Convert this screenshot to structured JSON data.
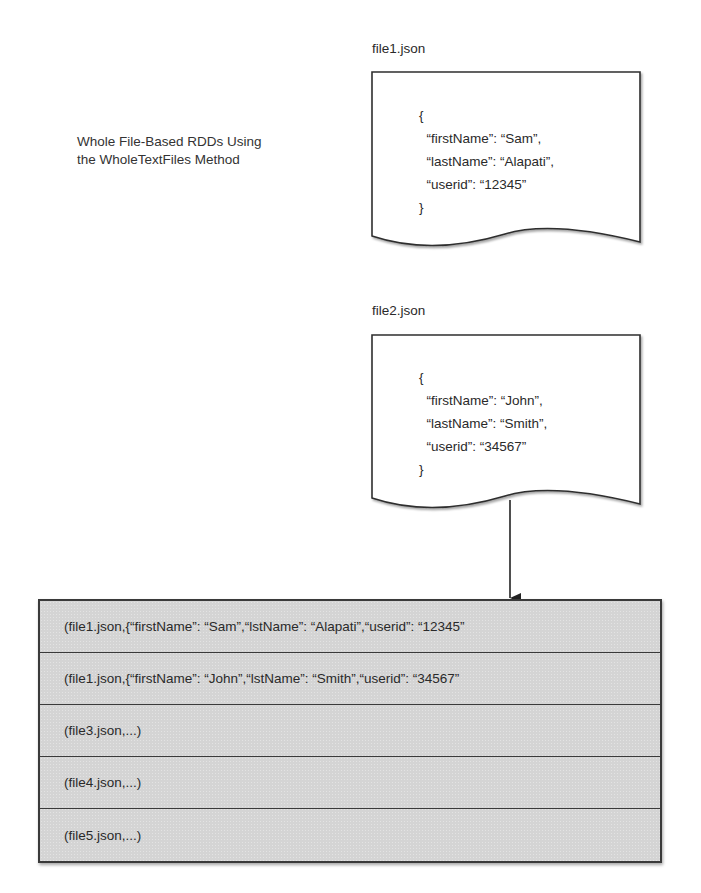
{
  "caption": {
    "line1": "Whole File-Based RDDs Using",
    "line2": "the WholeTextFiles Method"
  },
  "documents": [
    {
      "label": "file1.json",
      "lines": [
        "{",
        "  “firstName”: “Sam”,",
        "  “lastName”: “Alapati”,",
        "  “userid”: “12345”",
        "}"
      ]
    },
    {
      "label": "file2.json",
      "lines": [
        "{",
        "  “firstName”: “John”,",
        "  “lastName”: “Smith”,",
        "  “userid”: “34567”",
        "}"
      ]
    }
  ],
  "arrow": {
    "from": "file2.json",
    "to": "rdd",
    "icon": "arrow-down-icon"
  },
  "rdd": {
    "rows": [
      "(file1.json,{“firstName”: “Sam”,“lstName”: “Alapati”,“userid”: “12345”",
      "(file1.json,{“firstName”: “John”,“lstName”: “Smith”,“userid”: “34567”",
      "(file3.json,...)",
      "(file4.json,...)",
      "(file5.json,...)"
    ],
    "fill_color": "#d4d4d4",
    "border_color": "#3a3a3a"
  }
}
